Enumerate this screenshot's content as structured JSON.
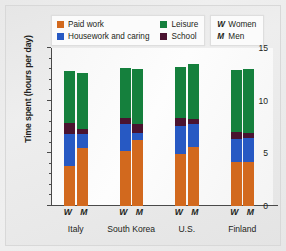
{
  "legend": {
    "series": [
      {
        "label": "Paid work",
        "color": "#d2691e",
        "swatch_name": "legend-swatch-paid-work"
      },
      {
        "label": "Housework and caring",
        "color": "#2759c3",
        "swatch_name": "legend-swatch-housework"
      },
      {
        "label": "Leisure",
        "color": "#15803d",
        "swatch_name": "legend-swatch-leisure"
      },
      {
        "label": "School",
        "color": "#4a1330",
        "swatch_name": "legend-swatch-school"
      }
    ],
    "key": [
      {
        "letter": "W",
        "label": "Women"
      },
      {
        "letter": "M",
        "label": "Men"
      }
    ]
  },
  "axis": {
    "y_label": "Time spent (hours per day)",
    "y_ticks_major": [
      "0",
      "5",
      "10",
      "15"
    ],
    "y_min": 0,
    "y_max": 15
  },
  "groups": [
    {
      "name": "Italy",
      "bars": [
        {
          "sex": "W"
        },
        {
          "sex": "M"
        }
      ]
    },
    {
      "name": "South Korea",
      "bars": [
        {
          "sex": "W"
        },
        {
          "sex": "M"
        }
      ]
    },
    {
      "name": "U.S.",
      "bars": [
        {
          "sex": "W"
        },
        {
          "sex": "M"
        }
      ]
    },
    {
      "name": "Finland",
      "bars": [
        {
          "sex": "W"
        },
        {
          "sex": "M"
        }
      ]
    }
  ],
  "chart_data": {
    "type": "bar",
    "subtype": "stacked",
    "title": "",
    "xlabel": "",
    "ylabel": "Time spent (hours per day)",
    "ylim": [
      0,
      15
    ],
    "ytick_interval_major": 5,
    "ytick_interval_minor": 1,
    "grid": false,
    "legend_position": "top",
    "categories": [
      "Italy W",
      "Italy M",
      "South Korea W",
      "South Korea M",
      "U.S. W",
      "U.S. M",
      "Finland W",
      "Finland M"
    ],
    "group_names": [
      "Italy",
      "South Korea",
      "U.S.",
      "Finland"
    ],
    "sex_labels": [
      "W",
      "M"
    ],
    "stack_order_bottom_to_top": [
      "Paid work",
      "Housework and caring",
      "School",
      "Leisure"
    ],
    "series": [
      {
        "name": "Paid work",
        "color": "#d2691e",
        "values": [
          3.8,
          5.5,
          5.2,
          6.3,
          4.9,
          5.6,
          4.2,
          4.2
        ]
      },
      {
        "name": "Housework and caring",
        "color": "#2759c3",
        "values": [
          3.0,
          1.3,
          2.6,
          0.6,
          2.7,
          2.2,
          2.2,
          2.3
        ]
      },
      {
        "name": "School",
        "color": "#4a1330",
        "values": [
          1.1,
          0.5,
          0.6,
          0.9,
          0.8,
          0.5,
          0.6,
          0.4
        ]
      },
      {
        "name": "Leisure",
        "color": "#15803d",
        "values": [
          4.9,
          5.3,
          4.7,
          5.2,
          4.8,
          5.2,
          5.9,
          6.1
        ]
      }
    ],
    "totals": [
      12.8,
      12.6,
      13.1,
      13.0,
      13.2,
      13.5,
      12.9,
      13.0
    ]
  }
}
